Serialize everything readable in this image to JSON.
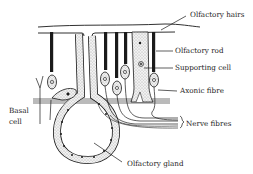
{
  "diagram": {
    "labels": {
      "olfactory_hairs": "Olfactory hairs",
      "olfactory_rod": "Olfactory rod",
      "supporting_cell": "Supporting cell",
      "axonic_fibre": "Axonic fibre",
      "nerve_fibres": "Nerve fibres",
      "basal_cell_line1": "Basal",
      "basal_cell_line2": "cell",
      "olfactory_gland": "Olfactory gland"
    },
    "colors": {
      "ink": "#1a1a1a",
      "paper": "#ffffff",
      "stipple": "#d8d8d8"
    }
  }
}
